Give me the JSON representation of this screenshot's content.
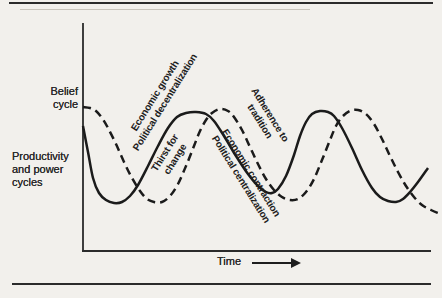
{
  "colors": {
    "ink": "#1b1b1b",
    "paper": "#f2f0ec"
  },
  "labels": {
    "belief_cycle": "Belief\ncycle",
    "productivity_power": "Productivity\nand power\ncycles",
    "time": "Time"
  },
  "chart_data": {
    "type": "line",
    "title": "",
    "xlabel": "Time",
    "ylabel": "",
    "x_axis": {
      "label": "Time",
      "arrow": true,
      "ticks": []
    },
    "y_axis": {
      "labels": [
        "Belief cycle",
        "Productivity and power cycles"
      ],
      "ticks": []
    },
    "grid": false,
    "legend": "none (curves identified by left-side labels: solid = productivity and power cycles, dashed = belief cycle)",
    "series": [
      {
        "name": "Productivity and power cycles",
        "line_style": "solid",
        "points_px": [
          [
            83,
            126
          ],
          [
            88,
            152
          ],
          [
            93,
            178
          ],
          [
            99,
            193
          ],
          [
            106,
            200
          ],
          [
            114,
            203
          ],
          [
            122,
            202
          ],
          [
            130,
            196
          ],
          [
            138,
            185
          ],
          [
            148,
            166
          ],
          [
            158,
            146
          ],
          [
            168,
            128
          ],
          [
            177,
            117
          ],
          [
            186,
            113
          ],
          [
            196,
            112
          ],
          [
            206,
            114
          ],
          [
            214,
            121
          ],
          [
            224,
            136
          ],
          [
            236,
            156
          ],
          [
            248,
            174
          ],
          [
            258,
            186
          ],
          [
            266,
            192
          ],
          [
            272,
            193
          ],
          [
            278,
            189
          ],
          [
            286,
            176
          ],
          [
            294,
            155
          ],
          [
            300,
            136
          ],
          [
            306,
            122
          ],
          [
            312,
            114
          ],
          [
            320,
            111
          ],
          [
            328,
            112
          ],
          [
            334,
            116
          ],
          [
            342,
            128
          ],
          [
            352,
            148
          ],
          [
            362,
            170
          ],
          [
            372,
            188
          ],
          [
            380,
            197
          ],
          [
            388,
            201
          ],
          [
            396,
            202
          ],
          [
            403,
            199
          ],
          [
            410,
            192
          ],
          [
            418,
            182
          ],
          [
            428,
            168
          ]
        ]
      },
      {
        "name": "Belief cycle",
        "line_style": "dashed",
        "points_px": [
          [
            83,
            107
          ],
          [
            90,
            108
          ],
          [
            96,
            111
          ],
          [
            102,
            118
          ],
          [
            108,
            128
          ],
          [
            116,
            144
          ],
          [
            124,
            162
          ],
          [
            132,
            178
          ],
          [
            140,
            191
          ],
          [
            147,
            199
          ],
          [
            154,
            202
          ],
          [
            162,
            202
          ],
          [
            170,
            196
          ],
          [
            178,
            184
          ],
          [
            186,
            166
          ],
          [
            194,
            146
          ],
          [
            200,
            131
          ],
          [
            206,
            120
          ],
          [
            212,
            113
          ],
          [
            220,
            109
          ],
          [
            228,
            111
          ],
          [
            234,
            117
          ],
          [
            242,
            130
          ],
          [
            250,
            147
          ],
          [
            258,
            164
          ],
          [
            266,
            179
          ],
          [
            274,
            190
          ],
          [
            282,
            197
          ],
          [
            290,
            200
          ],
          [
            298,
            199
          ],
          [
            306,
            192
          ],
          [
            314,
            179
          ],
          [
            322,
            160
          ],
          [
            330,
            140
          ],
          [
            336,
            126
          ],
          [
            342,
            117
          ],
          [
            350,
            111
          ],
          [
            358,
            110
          ],
          [
            366,
            114
          ],
          [
            374,
            124
          ],
          [
            382,
            139
          ],
          [
            390,
            156
          ],
          [
            398,
            172
          ],
          [
            406,
            186
          ],
          [
            414,
            197
          ],
          [
            422,
            205
          ],
          [
            431,
            210
          ],
          [
            440,
            214
          ]
        ]
      }
    ],
    "annotations": [
      {
        "text": "Economic growth\nPolitical decentralization",
        "rotation_deg": -58,
        "center_px": [
          160,
          99
        ]
      },
      {
        "text": "Thirst for\nchange",
        "rotation_deg": -58,
        "center_px": [
          170,
          156
        ]
      },
      {
        "text": "Adherence to\ntradition",
        "rotation_deg": 58,
        "center_px": [
          265,
          118
        ]
      },
      {
        "text": "Economic contraction\nPolitical centralization",
        "rotation_deg": 58,
        "center_px": [
          246,
          176
        ]
      }
    ]
  }
}
